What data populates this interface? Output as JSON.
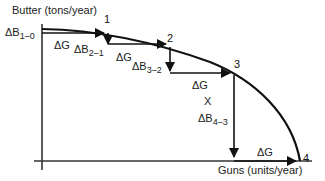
{
  "axes": {
    "y_label": "Butter (tons/year)",
    "x_label": "Guns (units/year)"
  },
  "points": [
    {
      "id": "1",
      "label": "1"
    },
    {
      "id": "2",
      "label": "2"
    },
    {
      "id": "3",
      "label": "3"
    },
    {
      "id": "4",
      "label": "4"
    }
  ],
  "labels": {
    "db10_main": "ΔB",
    "db10_sub": "1–0",
    "dg1": "ΔG",
    "db21_main": "ΔB",
    "db21_sub": "2–1",
    "dg2": "ΔG",
    "db32_main": "ΔB",
    "db32_sub": "3–2",
    "dg3": "ΔG",
    "x_mark": "X",
    "db43_main": "ΔB",
    "db43_sub": "4–3",
    "dg4": "ΔG"
  },
  "colors": {
    "line": "#111111",
    "background": "#ffffff"
  }
}
